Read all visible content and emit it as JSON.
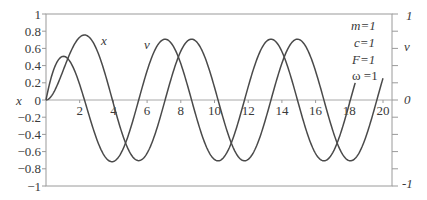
{
  "chart_data": {
    "type": "line",
    "title": "",
    "xlabel": "",
    "ylabel_left": "x",
    "ylabel_right": "v",
    "xlim": [
      0,
      20.5
    ],
    "ylim": [
      -1,
      1
    ],
    "x_ticks": [
      2,
      4,
      6,
      8,
      10,
      12,
      14,
      16,
      18,
      20
    ],
    "x_tick_labels": [
      "2",
      "4",
      "6",
      "8",
      "10",
      "12",
      "14",
      "16",
      "18",
      "20"
    ],
    "y_ticks_left": [
      1,
      0.8,
      0.6,
      0.4,
      0.2,
      0,
      -0.2,
      -0.4,
      -0.6,
      -0.8,
      -1
    ],
    "y_tick_labels_left": [
      "1",
      "0.8",
      "0.6",
      "0.4",
      "0.2",
      "0",
      "−0.2",
      "−0.4",
      "−0.6",
      "−0.8",
      "−1"
    ],
    "y_ticks_right": [
      1,
      0.8,
      0.6,
      0.4,
      0.2,
      0,
      -0.2,
      -0.4,
      -0.6,
      -0.8,
      -1
    ],
    "y_tick_labels_right": [
      {
        "value": 1,
        "label": "1"
      },
      {
        "value": 0.6,
        "label": "v"
      },
      {
        "value": 0,
        "label": "0"
      },
      {
        "value": -1,
        "label": "-1"
      }
    ],
    "grid": false,
    "legend": {
      "position": "top-right",
      "entries": [
        "m=1",
        "c=1",
        "F=1",
        "ω =1"
      ]
    },
    "annotations": [
      {
        "text": "x",
        "t": 3.4,
        "y": 0.68
      },
      {
        "text": "v",
        "t": 6.2,
        "y": 0.62
      }
    ],
    "series": [
      {
        "name": "x",
        "formula": "x(t) = (sin t − cos t + e^(−t)) / 2",
        "t_range": [
          0,
          20
        ],
        "points": [
          [
            0,
            0
          ],
          [
            0.5,
            0.126
          ],
          [
            1,
            0.335
          ],
          [
            1.5,
            0.611
          ],
          [
            2,
            0.73
          ],
          [
            2.3,
            0.756
          ],
          [
            2.5,
            0.748
          ],
          [
            3,
            0.52
          ],
          [
            3.5,
            0.287
          ],
          [
            4,
            -0.024
          ],
          [
            4.5,
            -0.381
          ],
          [
            5,
            -0.621
          ],
          [
            5.5,
            -0.704
          ],
          [
            6,
            -0.619
          ],
          [
            6.5,
            -0.514
          ],
          [
            7,
            -0.049
          ],
          [
            7.5,
            0.295
          ],
          [
            8,
            0.567
          ],
          [
            8.5,
            0.703
          ],
          [
            9,
            0.662
          ],
          [
            9.5,
            0.462
          ],
          [
            10,
            0.148
          ],
          [
            10.5,
            -0.206
          ],
          [
            11,
            -0.502
          ],
          [
            11.5,
            -0.672
          ],
          [
            12,
            -0.69
          ],
          [
            12.5,
            -0.548
          ],
          [
            13,
            -0.281
          ],
          [
            13.5,
            0.062
          ],
          [
            14,
            0.386
          ],
          [
            14.5,
            0.619
          ],
          [
            15,
            0.706
          ],
          [
            15.5,
            0.625
          ],
          [
            16,
            0.392
          ],
          [
            16.5,
            0.066
          ],
          [
            17,
            -0.279
          ],
          [
            17.5,
            -0.547
          ],
          [
            18,
            -0.69
          ],
          [
            18.5,
            -0.673
          ],
          [
            19,
            -0.502
          ],
          [
            19.5,
            -0.206
          ],
          [
            20,
            0.252
          ]
        ]
      },
      {
        "name": "v",
        "formula": "v(t) = (cos t + sin t − e^(−t)) / 2",
        "t_range": [
          0,
          18.35
        ],
        "points": [
          [
            0,
            0
          ],
          [
            0.5,
            0.376
          ],
          [
            1,
            0.507
          ],
          [
            1.5,
            0.423
          ],
          [
            2,
            0.179
          ],
          [
            2.5,
            -0.14
          ],
          [
            3,
            -0.449
          ],
          [
            3.5,
            -0.643
          ],
          [
            4,
            -0.706
          ],
          [
            4.5,
            -0.598
          ],
          [
            5,
            -0.339
          ],
          [
            5.5,
            -0.006
          ],
          [
            6,
            0.341
          ],
          [
            6.5,
            0.598
          ],
          [
            7,
            0.705
          ],
          [
            7.5,
            0.643
          ],
          [
            8,
            0.422
          ],
          [
            8.5,
            0.101
          ],
          [
            9,
            -0.249
          ],
          [
            9.5,
            -0.537
          ],
          [
            10,
            -0.692
          ],
          [
            10.5,
            -0.675
          ],
          [
            11,
            -0.488
          ],
          [
            11.5,
            -0.187
          ],
          [
            12,
            0.158
          ],
          [
            12.5,
            0.472
          ],
          [
            13,
            0.664
          ],
          [
            13.5,
            0.702
          ],
          [
            14,
            0.571
          ],
          [
            14.5,
            0.3
          ],
          [
            15,
            -0.054
          ],
          [
            15.5,
            -0.388
          ],
          [
            16,
            -0.617
          ],
          [
            16.5,
            -0.706
          ],
          [
            17,
            -0.62
          ],
          [
            17.5,
            -0.401
          ],
          [
            18,
            -0.083
          ],
          [
            18.35,
            0.165
          ]
        ]
      }
    ]
  },
  "chart": {
    "y_axis_left_name": "x",
    "params": [
      "m=1",
      "c=1",
      "F=1",
      "ω =1"
    ],
    "series_labels": {
      "x": "x",
      "v": "v"
    },
    "right_axis": {
      "top": "1",
      "name": "v",
      "zero": "0",
      "bottom": "-1"
    }
  }
}
